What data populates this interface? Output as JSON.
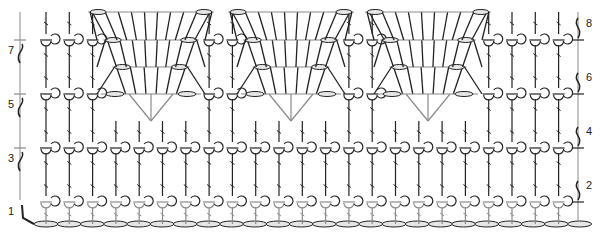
{
  "diagram": {
    "type": "crochet-stitch-chart",
    "colors": {
      "ink": "#222222",
      "light_ink": "#8a8a8a",
      "oval_fill": "#e6e6e6"
    },
    "row_labels_left": [
      "1",
      "3",
      "5",
      "7"
    ],
    "row_labels_right": [
      "2",
      "4",
      "6",
      "8"
    ],
    "rows": 8,
    "columns": 24,
    "repeats": 3,
    "foundation": "chain"
  },
  "labels": {
    "r1": "1",
    "r2": "2",
    "r3": "3",
    "r4": "4",
    "r5": "5",
    "r6": "6",
    "r7": "7",
    "r8": "8"
  }
}
